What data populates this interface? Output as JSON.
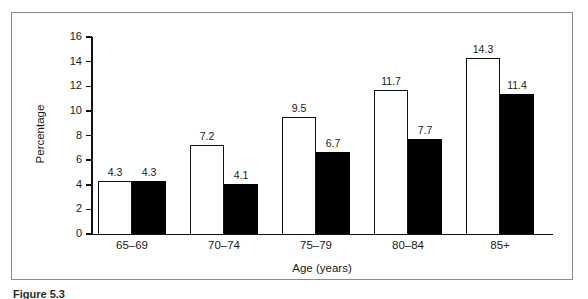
{
  "figure": {
    "caption": "Figure 5.3",
    "frame_color": "#8b8b8b",
    "background": "#ffffff"
  },
  "chart_data": {
    "type": "bar",
    "title": "",
    "subtitle": "",
    "xlabel": "Age (years)",
    "ylabel": "Percentage",
    "categories": [
      "65–69",
      "70–74",
      "75–79",
      "80–84",
      "85+"
    ],
    "ylim": [
      0,
      16
    ],
    "yticks": [
      0,
      2,
      4,
      6,
      8,
      10,
      12,
      14,
      16
    ],
    "ytick_labels": [
      "0",
      "2",
      "4",
      "6",
      "8",
      "10",
      "12",
      "14",
      "16"
    ],
    "grid": false,
    "legend": "none",
    "series": [
      {
        "name": "series-open",
        "fill": "#ffffff",
        "edge": "#111111",
        "values": [
          4.3,
          7.2,
          9.5,
          11.7,
          14.3
        ],
        "labels": [
          "4.3",
          "7.2",
          "9.5",
          "11.7",
          "14.3"
        ]
      },
      {
        "name": "series-filled",
        "fill": "#000000",
        "edge": "#000000",
        "values": [
          4.3,
          4.1,
          6.7,
          7.7,
          11.4
        ],
        "labels": [
          "4.3",
          "4.1",
          "6.7",
          "7.7",
          "11.4"
        ]
      }
    ]
  }
}
